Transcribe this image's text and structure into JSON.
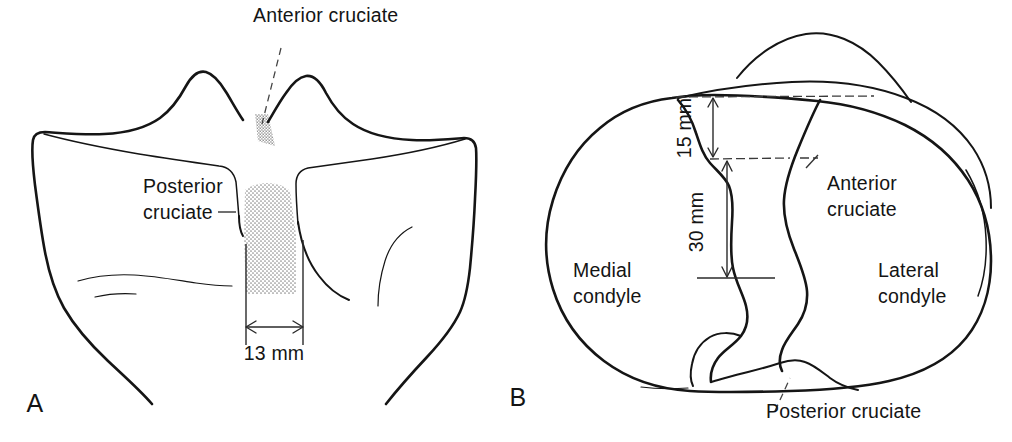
{
  "figure": {
    "kind": "anatomical-line-drawing",
    "background_color": "#ffffff",
    "ink_color": "#151515",
    "stipple_color": "#9a9a9a"
  },
  "panel_a": {
    "id": "A",
    "view": "anterior",
    "labels": {
      "anterior_cruciate": "Anterior cruciate",
      "posterior_cruciate_line1": "Posterior",
      "posterior_cruciate_line2": "cruciate"
    },
    "dimensions": [
      {
        "name": "plateau-width",
        "value": "13 mm",
        "orientation": "horizontal"
      }
    ]
  },
  "panel_b": {
    "id": "B",
    "view": "superior",
    "labels": {
      "medial_condyle_line1": "Medial",
      "medial_condyle_line2": "condyle",
      "lateral_condyle_line1": "Lateral",
      "lateral_condyle_line2": "condyle",
      "anterior_cruciate_line1": "Anterior",
      "anterior_cruciate_line2": "cruciate",
      "posterior_cruciate": "Posterior cruciate"
    },
    "dimensions": [
      {
        "name": "anterior-offset",
        "value": "15 mm",
        "orientation": "vertical-rotated"
      },
      {
        "name": "intercondylar-span",
        "value": "30 mm",
        "orientation": "vertical-rotated"
      }
    ]
  }
}
